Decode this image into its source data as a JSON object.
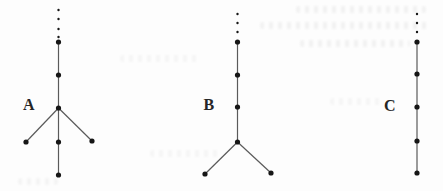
{
  "figure": {
    "width": 443,
    "height": 191,
    "background_color": "#fdfdfd",
    "line_color": "#5a5a5a",
    "dot_color": "#161616",
    "label_color": "#262626",
    "node_radius": 2.6,
    "continuation_dot_radius": 1.2,
    "diagrams": [
      {
        "label": "A",
        "description": "vertical chain continuing upward (dotted), branching into three children, center child continues down",
        "trunk": {
          "x": 58.5,
          "y1": 42,
          "y2": 175
        },
        "continuation_dots": [
          {
            "x": 58.5,
            "y": 10
          },
          {
            "x": 58.5,
            "y": 19
          },
          {
            "x": 58.5,
            "y": 29
          },
          {
            "x": 58.5,
            "y": 37
          }
        ],
        "nodes": [
          {
            "x": 58.5,
            "y": 42
          },
          {
            "x": 58.5,
            "y": 75
          },
          {
            "x": 58.5,
            "y": 108
          },
          {
            "x": 26,
            "y": 142
          },
          {
            "x": 58.5,
            "y": 142
          },
          {
            "x": 92,
            "y": 141
          },
          {
            "x": 58.5,
            "y": 175
          }
        ],
        "edges": [
          [
            58.5,
            108,
            26,
            142
          ],
          [
            58.5,
            108,
            92,
            141
          ]
        ]
      },
      {
        "label": "B",
        "description": "vertical chain continuing upward (dotted), ending in a two-way branch at the bottom",
        "trunk": {
          "x": 237.5,
          "y1": 42,
          "y2": 142
        },
        "continuation_dots": [
          {
            "x": 237.5,
            "y": 14
          },
          {
            "x": 237.5,
            "y": 23
          },
          {
            "x": 237.5,
            "y": 32
          }
        ],
        "nodes": [
          {
            "x": 237.5,
            "y": 42
          },
          {
            "x": 237.5,
            "y": 75
          },
          {
            "x": 237.5,
            "y": 107
          },
          {
            "x": 237.5,
            "y": 142
          },
          {
            "x": 205,
            "y": 174
          },
          {
            "x": 271,
            "y": 173
          }
        ],
        "edges": [
          [
            237.5,
            142,
            205,
            174
          ],
          [
            237.5,
            142,
            271,
            173
          ]
        ]
      },
      {
        "label": "C",
        "description": "straight vertical chain continuing upward (dotted), no branching",
        "trunk": {
          "x": 417,
          "y1": 42,
          "y2": 173
        },
        "continuation_dots": [
          {
            "x": 417,
            "y": 14
          },
          {
            "x": 417,
            "y": 23
          },
          {
            "x": 417,
            "y": 32
          }
        ],
        "nodes": [
          {
            "x": 417,
            "y": 42
          },
          {
            "x": 417,
            "y": 74
          },
          {
            "x": 417,
            "y": 107
          },
          {
            "x": 417,
            "y": 141
          },
          {
            "x": 417,
            "y": 173
          }
        ],
        "edges": []
      }
    ]
  }
}
